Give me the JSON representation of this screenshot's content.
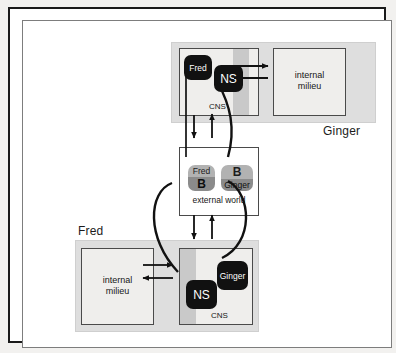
{
  "figure": {
    "background": "#ffffff",
    "frame_color": "#1a1a1a"
  },
  "organisms": [
    {
      "id": "ginger",
      "label": "Ginger",
      "position": "top",
      "cns_label": "CNS",
      "internal_label_line1": "internal",
      "internal_label_line2": "milieu",
      "chips": [
        {
          "name": "fred-chip-top",
          "text": "Fred",
          "style": "dark"
        },
        {
          "name": "ns-chip-top",
          "text": "NS",
          "style": "dark"
        }
      ]
    },
    {
      "id": "fred",
      "label": "Fred",
      "position": "bottom",
      "cns_label": "CNS",
      "internal_label_line1": "internal",
      "internal_label_line2": "milieu",
      "chips": [
        {
          "name": "ginger-chip-bottom",
          "text": "Ginger",
          "style": "dark"
        },
        {
          "name": "ns-chip-bottom",
          "text": "NS",
          "style": "dark"
        }
      ]
    }
  ],
  "external_world": {
    "label": "external  world",
    "actors": [
      {
        "name": "fred-b-actor",
        "top_text": "Fred",
        "bottom_text": "B",
        "top_color": "#b2b2b2",
        "bottom_color": "#8b8b8b"
      },
      {
        "name": "b-ginger-actor",
        "top_text": "B",
        "bottom_text": "Ginger",
        "top_color": "#b2b2b2",
        "bottom_color": "#8b8b8b"
      }
    ]
  },
  "colors": {
    "organism_fill": "#dedede",
    "cns_fill": "#efeeec",
    "cns_band": "#c9c9c9",
    "internal_fill": "#efeeec",
    "external_fill": "#ffffff",
    "chip_dark": "#111111",
    "chip_light": "#b2b2b2",
    "chip_mid": "#8b8b8b",
    "stroke": "#111111"
  },
  "links": [
    {
      "name": "ginger-ns-to-internal",
      "kind": "arrow",
      "direction": "right"
    },
    {
      "name": "ginger-internal-to-ns",
      "kind": "arrow",
      "direction": "left"
    },
    {
      "name": "fred-ns-to-internal",
      "kind": "arrow",
      "direction": "right"
    },
    {
      "name": "fred-internal-to-ns",
      "kind": "arrow",
      "direction": "left"
    },
    {
      "name": "ginger-cns-down-to-external",
      "kind": "arrow",
      "direction": "down"
    },
    {
      "name": "external-up-to-ginger-cns",
      "kind": "arrow",
      "direction": "up"
    },
    {
      "name": "external-down-to-fred-cns",
      "kind": "arrow",
      "direction": "down"
    },
    {
      "name": "fred-cns-up-to-external",
      "kind": "arrow",
      "direction": "up"
    },
    {
      "name": "fred-chip-to-fred-b-actor",
      "kind": "line"
    },
    {
      "name": "ginger-ns-curve-to-b-ginger-actor",
      "kind": "curve"
    },
    {
      "name": "fred-b-actor-curve-to-fred-ns",
      "kind": "curve"
    },
    {
      "name": "b-ginger-actor-curve-to-ginger-chip",
      "kind": "curve"
    }
  ]
}
